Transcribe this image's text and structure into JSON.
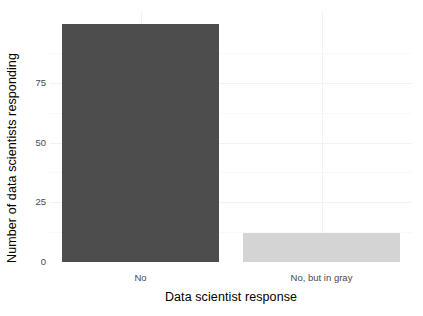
{
  "chart_data": {
    "type": "bar",
    "title": "",
    "subtitle": "",
    "xlabel": "Data scientist response",
    "ylabel": "Number of data scientists responding",
    "categories": [
      "No",
      "No, but in gray"
    ],
    "values": [
      98,
      12
    ],
    "series": [
      {
        "name": "Number of data scientists responding",
        "values": [
          98,
          12
        ]
      }
    ],
    "bar_colors": [
      "#4d4d4d",
      "#d4d4d4"
    ],
    "ylim": [
      0,
      103
    ],
    "yticks": [
      0,
      25,
      50,
      75
    ],
    "ytick_labels": [
      "0",
      "25",
      "50",
      "75"
    ],
    "xticks": [
      "No",
      "No, but in gray"
    ],
    "grid": true,
    "grid_color": "#f2f2f2",
    "legend": "none",
    "panel_background": "#ffffff",
    "annotations": []
  },
  "axes": {
    "y_title": "Number of data scientists responding",
    "x_title": "Data scientist response"
  },
  "colors": {
    "bar_dark": "#4d4d4d",
    "bar_light": "#d4d4d4",
    "text": "#000000",
    "tick_text": "#4a4a4a",
    "gridline": "#f2f2f2",
    "background": "#ffffff"
  }
}
